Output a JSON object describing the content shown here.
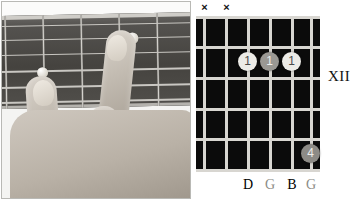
{
  "figure": {
    "kind": "guitar-chord-figure",
    "position_label": "XII"
  },
  "photo": {
    "alt": "photograph of a left hand fretting a guitar neck",
    "inlay_markers": 2,
    "visible_fingers": 4
  },
  "chord_diagram": {
    "strings": 6,
    "frets": 5,
    "string_markers": [
      "x",
      "x",
      "",
      "",
      "",
      ""
    ],
    "mute_symbol": "×",
    "dots": [
      {
        "string": 3,
        "fret": 2,
        "label": "1",
        "shade": "light"
      },
      {
        "string": 4,
        "fret": 2,
        "label": "1",
        "shade": "mid"
      },
      {
        "string": 5,
        "fret": 2,
        "label": "1",
        "shade": "light"
      },
      {
        "string": 6,
        "fret": 5,
        "label": "4",
        "shade": "dark"
      }
    ],
    "note_names": [
      "",
      "",
      "D",
      "G",
      "B",
      "G"
    ],
    "colors": {
      "board": "#0b0b0b",
      "lines": "#d8d6d1",
      "dot_light": "#ecebe7",
      "dot_mid": "#9a9893",
      "dot_dark": "#8d8b86"
    }
  }
}
